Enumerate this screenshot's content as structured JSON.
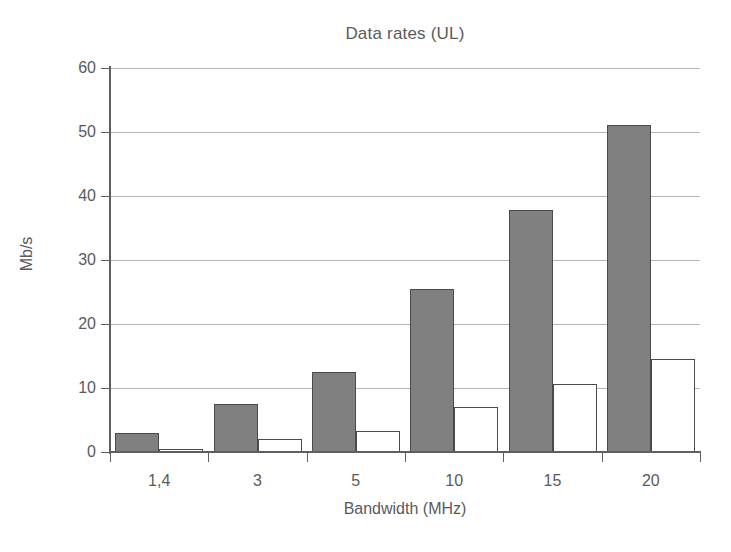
{
  "chart_data": {
    "type": "bar",
    "title": "Data rates (UL)",
    "xlabel": "Bandwidth (MHz)",
    "ylabel": "Mb/s",
    "categories": [
      "1,4",
      "3",
      "5",
      "10",
      "15",
      "20"
    ],
    "series": [
      {
        "name": "series-1",
        "color": "#808080",
        "values": [
          3.0,
          7.5,
          12.5,
          25.5,
          37.8,
          51.1
        ]
      },
      {
        "name": "series-2",
        "color": "#ffffff",
        "values": [
          0.5,
          2.0,
          3.3,
          7.0,
          10.6,
          14.6
        ]
      }
    ],
    "ylim": [
      0,
      60
    ],
    "ytick_values": [
      0,
      10,
      20,
      30,
      40,
      50,
      60
    ],
    "ytick_labels": [
      "0",
      "10",
      "20",
      "30",
      "40",
      "50",
      "60"
    ],
    "grid": true,
    "grid_axis": "y",
    "legend": false,
    "legend_position": "none"
  }
}
